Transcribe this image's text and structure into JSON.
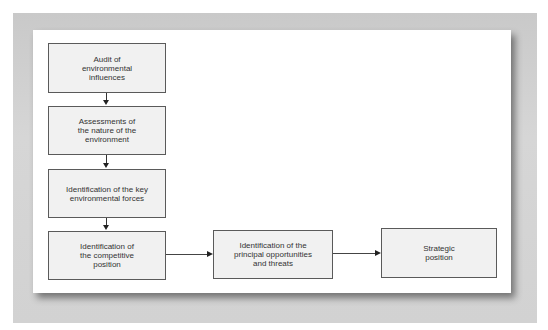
{
  "diagram": {
    "type": "flowchart",
    "boxes": [
      {
        "id": "audit",
        "label": "Audit of environmental influences"
      },
      {
        "id": "assess",
        "label": "Assessments of the nature of the environment"
      },
      {
        "id": "forces",
        "label": "Identification of the key environmental forces"
      },
      {
        "id": "competitive",
        "label": "Identification of the competitive position"
      },
      {
        "id": "opportunities",
        "label": "Identification of the principal opportunities and threats"
      },
      {
        "id": "strategic",
        "label": "Strategic position"
      }
    ],
    "edges": [
      {
        "from": "audit",
        "to": "assess"
      },
      {
        "from": "assess",
        "to": "forces"
      },
      {
        "from": "forces",
        "to": "competitive"
      },
      {
        "from": "competitive",
        "to": "opportunities"
      },
      {
        "from": "opportunities",
        "to": "strategic"
      }
    ],
    "colors": {
      "box_fill": "#f1f1f1",
      "box_border": "#5a5a5a",
      "frame": "#cfcfcf",
      "panel": "#ffffff"
    }
  }
}
